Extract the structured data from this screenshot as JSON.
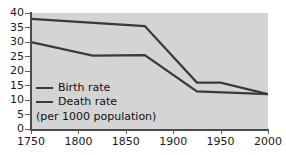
{
  "chart_data": {
    "type": "line",
    "title": "",
    "subtitle": "",
    "xlabel": "",
    "ylabel": "",
    "note": "(per 1000 population)",
    "xlim": [
      1750,
      2000
    ],
    "ylim": [
      0,
      40
    ],
    "grid": false,
    "legend_position": "inside-bottom-left",
    "x_ticks": [
      "1750",
      "1800",
      "1850",
      "1900",
      "1950",
      "2000"
    ],
    "y_ticks": [
      "0",
      "5",
      "10",
      "15",
      "20",
      "25",
      "30",
      "35",
      "40"
    ],
    "series": [
      {
        "name": "Birth rate",
        "color": "#3a3a3a",
        "x": [
          1750,
          1870,
          1925,
          1950,
          2000
        ],
        "values": [
          38,
          35.5,
          16,
          16,
          12
        ]
      },
      {
        "name": "Death rate",
        "color": "#3a3a3a",
        "x": [
          1750,
          1815,
          1870,
          1925,
          2000
        ],
        "values": [
          30,
          25.3,
          25.5,
          13,
          12
        ]
      }
    ]
  },
  "legend": {
    "items": [
      {
        "label": "Birth rate"
      },
      {
        "label": "Death rate"
      }
    ],
    "note": "(per 1000 population)"
  },
  "colors": {
    "plot_background": "#d4d4d4",
    "page_background": "#ffffff",
    "axis": "#4a4a4a",
    "line": "#3a3a3a",
    "text": "#111111"
  }
}
